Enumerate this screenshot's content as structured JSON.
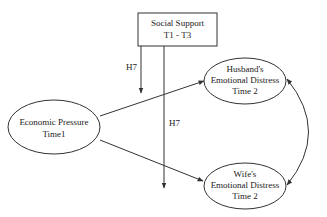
{
  "diagram": {
    "type": "path-model",
    "nodes": {
      "social_support": {
        "lines": [
          "Social Support",
          "T1 - T3"
        ],
        "shape": "rectangle"
      },
      "economic_pressure": {
        "lines": [
          "Economic Pressure",
          "Time1"
        ],
        "shape": "ellipse"
      },
      "husband_distress": {
        "lines": [
          "Husband's",
          "Emotional Distress",
          "Time 2"
        ],
        "shape": "ellipse"
      },
      "wife_distress": {
        "lines": [
          "Wife's",
          "Emotional Distress",
          "Time 2"
        ],
        "shape": "ellipse"
      }
    },
    "edge_labels": {
      "h7_upper": "H7",
      "h7_lower": "H7"
    },
    "edges": [
      {
        "from": "economic_pressure",
        "to": "husband_distress",
        "type": "directed"
      },
      {
        "from": "economic_pressure",
        "to": "wife_distress",
        "type": "directed"
      },
      {
        "from": "social_support",
        "to": "path:economic_pressure->husband_distress",
        "label": "H7",
        "type": "moderation"
      },
      {
        "from": "social_support",
        "to": "path:economic_pressure->wife_distress",
        "label": "H7",
        "type": "moderation"
      },
      {
        "from": "husband_distress",
        "to": "wife_distress",
        "type": "bidirectional-covariance"
      }
    ],
    "colors": {
      "stroke": "#333333",
      "background": "#ffffff"
    }
  }
}
